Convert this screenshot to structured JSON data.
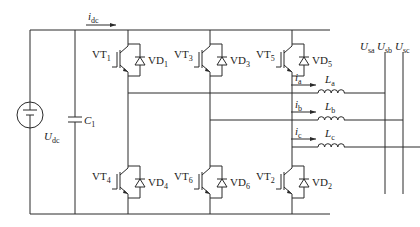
{
  "diagram": {
    "dc_side": {
      "source_label": "U",
      "source_sub": "dc",
      "capacitor_label": "C",
      "capacitor_sub": "1",
      "current_label": "i",
      "current_sub": "dc"
    },
    "switches": [
      {
        "t": "VT",
        "t_sub": "1",
        "d": "VD",
        "d_sub": "1"
      },
      {
        "t": "VT",
        "t_sub": "3",
        "d": "VD",
        "d_sub": "3"
      },
      {
        "t": "VT",
        "t_sub": "5",
        "d": "VD",
        "d_sub": "5"
      },
      {
        "t": "VT",
        "t_sub": "4",
        "d": "VD",
        "d_sub": "4"
      },
      {
        "t": "VT",
        "t_sub": "6",
        "d": "VD",
        "d_sub": "6"
      },
      {
        "t": "VT",
        "t_sub": "2",
        "d": "VD",
        "d_sub": "2"
      }
    ],
    "phases": [
      {
        "i": "i",
        "i_sub": "a",
        "L": "L",
        "L_sub": "a",
        "U": "U",
        "U_sub": "sa"
      },
      {
        "i": "i",
        "i_sub": "b",
        "L": "L",
        "L_sub": "b",
        "U": "U",
        "U_sub": "sb"
      },
      {
        "i": "i",
        "i_sub": "c",
        "L": "L",
        "L_sub": "c",
        "U": "U",
        "U_sub": "sc"
      }
    ]
  }
}
